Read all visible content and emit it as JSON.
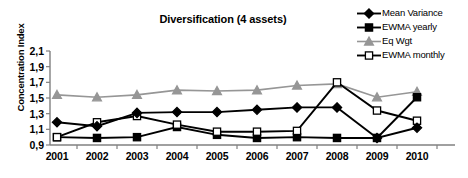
{
  "chart_data": {
    "type": "line",
    "title": "Diversification (4 assets)",
    "xlabel": "",
    "ylabel": "Concentration Index",
    "categories": [
      "2001",
      "2002",
      "2003",
      "2004",
      "2005",
      "2006",
      "2007",
      "2008",
      "2009",
      "2010"
    ],
    "ylim": [
      0.9,
      2.1
    ],
    "ytick_labels": [
      "2,1",
      "1,9",
      "1,7",
      "1,5",
      "1,3",
      "1,1",
      "0,9"
    ],
    "ytick_values": [
      2.1,
      1.9,
      1.7,
      1.5,
      1.3,
      1.1,
      0.9
    ],
    "grid": false,
    "legend_position": "top-right",
    "series": [
      {
        "name": "Mean Variance",
        "marker": "diamond",
        "color": "#000000",
        "marker_fill": "#000000",
        "values": [
          1.19,
          1.14,
          1.31,
          1.32,
          1.32,
          1.35,
          1.38,
          1.38,
          0.99,
          1.12
        ]
      },
      {
        "name": "EWMA yearly",
        "marker": "square",
        "color": "#000000",
        "marker_fill": "#000000",
        "values": [
          1.0,
          0.99,
          1.0,
          1.13,
          1.03,
          0.99,
          1.0,
          0.99,
          0.99,
          1.51
        ]
      },
      {
        "name": "Eq Wgt",
        "marker": "triangle",
        "color": "#969696",
        "marker_fill": "#969696",
        "values": [
          1.54,
          1.51,
          1.54,
          1.6,
          1.59,
          1.6,
          1.66,
          1.68,
          1.51,
          1.58
        ]
      },
      {
        "name": "EWMA monthly",
        "marker": "square-open",
        "color": "#000000",
        "marker_fill": "#ffffff",
        "values": [
          1.0,
          1.19,
          1.27,
          1.16,
          1.07,
          1.07,
          1.08,
          1.7,
          1.34,
          1.21
        ]
      }
    ]
  }
}
